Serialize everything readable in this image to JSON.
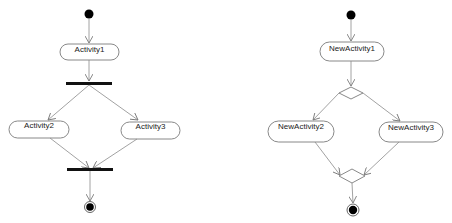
{
  "diagrams": [
    {
      "kind": "fork-join",
      "activities": [
        {
          "label": "Activity1"
        },
        {
          "label": "Activity2"
        },
        {
          "label": "Activity3"
        }
      ]
    },
    {
      "kind": "decision-merge",
      "activities": [
        {
          "label": "NewActivity1"
        },
        {
          "label": "NewActivity2"
        },
        {
          "label": "NewActivity3"
        }
      ]
    }
  ],
  "colors": {
    "line": "#8a8a8a",
    "bar": "#111111",
    "node_fill": "#ffffff"
  }
}
